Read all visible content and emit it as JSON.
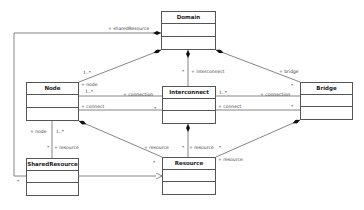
{
  "classes": [
    {
      "id": "domain",
      "name": "Domain",
      "x": 161,
      "y": 11,
      "w": 55,
      "h": 39
    },
    {
      "id": "node",
      "name": "Node",
      "x": 26,
      "y": 82,
      "w": 53,
      "h": 39
    },
    {
      "id": "interconnect",
      "name": "Interconnect",
      "x": 162,
      "y": 86,
      "w": 54,
      "h": 38
    },
    {
      "id": "bridge",
      "name": "Bridge",
      "x": 300,
      "y": 82,
      "w": 53,
      "h": 38
    },
    {
      "id": "sharedresource",
      "name": "SharedResource",
      "x": 26,
      "y": 158,
      "w": 53,
      "h": 38
    },
    {
      "id": "resource",
      "name": "Resource",
      "x": 162,
      "y": 157,
      "w": 54,
      "h": 38
    }
  ],
  "labels": {
    "shared_resource_role": "+ sharedResource",
    "node_mult_domain": "1..*",
    "node_role": "+ node",
    "node_mult": "1..*",
    "interconnect_role": "+ interconnect",
    "interconnect_mult_domain": "*",
    "bridge_role": "+ bridge",
    "bridge_mult": "*",
    "connection_left": "+ connection",
    "connection_left_mult": "*",
    "connect_left": "+ connect",
    "connection_right": "+ connection",
    "connection_right_mult": "*",
    "connect_right_mult_a": "1..*",
    "connect_right": "+ connect",
    "connect_bridge_mult": "*",
    "node_role_lower": "+ node",
    "node_lower_mult": "1..*",
    "resource_shared_role": "+ resource",
    "resource_shared_mult": "*",
    "resource_node_role": "+ resource",
    "resource_node_mult": "*",
    "resource_ic_role": "+ resource",
    "resource_ic_mult_left": "*",
    "resource_ic_mult_right": "*",
    "resource_bridge_role": "+ resource",
    "shared_mult_left": "*"
  }
}
